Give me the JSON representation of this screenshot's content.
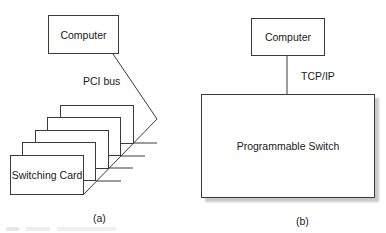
{
  "panel_a": {
    "computer_label": "Computer",
    "bus_label": "PCI bus",
    "cards": [
      {
        "label": ""
      },
      {
        "label": ""
      },
      {
        "label": ""
      },
      {
        "label": ""
      },
      {
        "label": "Switching Card"
      }
    ],
    "caption": "(a)"
  },
  "panel_b": {
    "computer_label": "Computer",
    "link_label": "TCP/IP",
    "switch_label": "Programmable Switch",
    "caption": "(b)"
  },
  "colors": {
    "stroke": "#3a3a3a",
    "shadow": "#c9c9c9",
    "background": "#ffffff"
  }
}
